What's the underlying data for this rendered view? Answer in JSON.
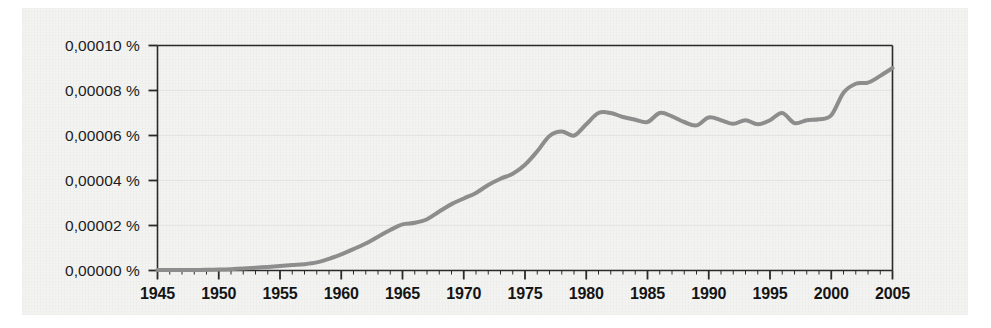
{
  "figure": {
    "background_color": "#f3f3f2",
    "page_color": "#ffffff",
    "frame_color": "#2a2a2a",
    "gridline_color": "#e4e4e4"
  },
  "chart_data": {
    "type": "line",
    "title": "",
    "subtitle": "",
    "xlabel": "",
    "ylabel": "",
    "grid": true,
    "legend": "none",
    "line_color": "#8d8d8d",
    "line_width": 4,
    "xlim": [
      1945,
      2005
    ],
    "ylim": [
      0.0,
      0.0001
    ],
    "y_tick_labels": [
      "0,00010 %",
      "0,00008 %",
      "0,00006 %",
      "0,00004 %",
      "0,00002 %",
      "0,00000 %"
    ],
    "y_tick_values": [
      0.0001,
      8e-05,
      6e-05,
      4e-05,
      2e-05,
      0.0
    ],
    "x_tick_labels": [
      "1945",
      "1950",
      "1955",
      "1960",
      "1965",
      "1970",
      "1975",
      "1980",
      "1985",
      "1990",
      "1995",
      "2000",
      "2005"
    ],
    "x_tick_values": [
      1945,
      1950,
      1955,
      1960,
      1965,
      1970,
      1975,
      1980,
      1985,
      1990,
      1995,
      2000,
      2005
    ],
    "x_minor_tick_step": 1,
    "series": [
      {
        "name": "value",
        "x": [
          1945,
          1946,
          1947,
          1948,
          1949,
          1950,
          1951,
          1952,
          1953,
          1954,
          1955,
          1956,
          1957,
          1958,
          1959,
          1960,
          1961,
          1962,
          1963,
          1964,
          1965,
          1966,
          1967,
          1968,
          1969,
          1970,
          1971,
          1972,
          1973,
          1974,
          1975,
          1976,
          1977,
          1978,
          1979,
          1980,
          1981,
          1982,
          1983,
          1984,
          1985,
          1986,
          1987,
          1988,
          1989,
          1990,
          1991,
          1992,
          1993,
          1994,
          1995,
          1996,
          1997,
          1998,
          1999,
          2000,
          2001,
          2002,
          2003,
          2004,
          2005
        ],
        "y": [
          2e-07,
          2e-07,
          2e-07,
          2e-07,
          3e-07,
          4e-07,
          6e-07,
          9e-07,
          1.2e-06,
          1.6e-06,
          2e-06,
          2.4e-06,
          2.8e-06,
          3.6e-06,
          5.2e-06,
          7.2e-06,
          9.5e-06,
          1.2e-05,
          1.5e-05,
          1.8e-05,
          2.05e-05,
          2.12e-05,
          2.28e-05,
          2.62e-05,
          2.95e-05,
          3.2e-05,
          3.45e-05,
          3.8e-05,
          4.08e-05,
          4.3e-05,
          4.7e-05,
          5.3e-05,
          5.98e-05,
          6.18e-05,
          6e-05,
          6.5e-05,
          7e-05,
          7e-05,
          6.82e-05,
          6.7e-05,
          6.6e-05,
          7e-05,
          6.85e-05,
          6.6e-05,
          6.45e-05,
          6.8e-05,
          6.68e-05,
          6.52e-05,
          6.68e-05,
          6.5e-05,
          6.68e-05,
          7e-05,
          6.55e-05,
          6.68e-05,
          6.72e-05,
          6.9e-05,
          7.9e-05,
          8.3e-05,
          8.35e-05,
          8.65e-05,
          9e-05
        ]
      }
    ]
  }
}
